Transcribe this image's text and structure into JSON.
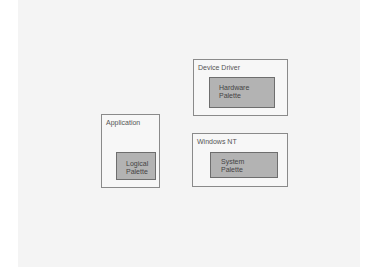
{
  "diagram": {
    "boxes": [
      {
        "id": "device-driver",
        "label": "Device Driver",
        "inner": {
          "lines": [
            "Hardware",
            "Palette"
          ]
        }
      },
      {
        "id": "application",
        "label": "Application",
        "inner": {
          "lines": [
            "Logical",
            "Palette"
          ]
        }
      },
      {
        "id": "windows-nt",
        "label": "Windows NT",
        "inner": {
          "lines": [
            "System",
            "Palette"
          ]
        }
      }
    ]
  },
  "colors": {
    "background": "#f4f4f4",
    "outer_box_fill": "#f7f7f7",
    "outer_box_border": "#8a8a8a",
    "inner_box_fill": "#b3b3b3",
    "inner_box_border": "#6e6e6e"
  }
}
